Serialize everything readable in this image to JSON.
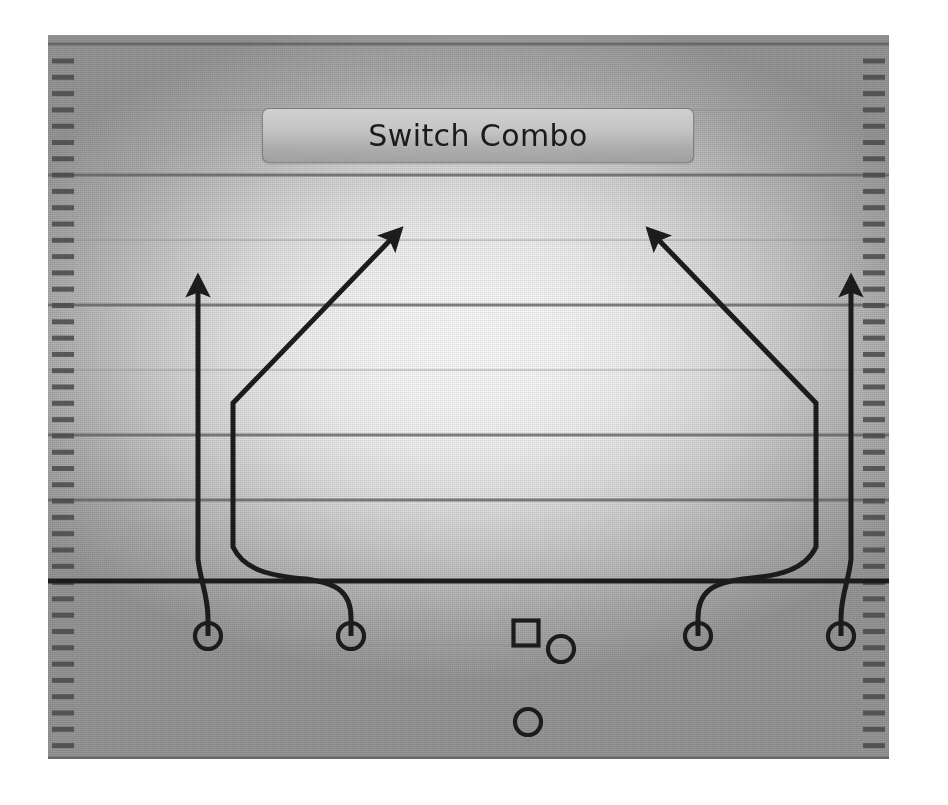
{
  "play": {
    "title": "Switch Combo",
    "banner": {
      "x": 262,
      "y": 108,
      "width": 432,
      "height": 55
    }
  },
  "field": {
    "x": 48,
    "y": 35,
    "width": 841,
    "height": 724,
    "background_center_color": "#fdfdfd",
    "background_edge_color": "#9a9a9a",
    "line_color": "#8d8d8d",
    "bold_line_color": "#5f5f5f",
    "ink_color": "#1c1c1c",
    "yard_lines": [
      9,
      75,
      140,
      205,
      270,
      335,
      400,
      465,
      610,
      675,
      723
    ],
    "bold_yard_lines": [
      9,
      140,
      270,
      400,
      465,
      723
    ],
    "hash_marks": {
      "count": 44,
      "spacing": 16.3,
      "start_y": 26,
      "length": 22,
      "thickness": 5,
      "left_x": 4,
      "right_x": 815
    },
    "line_of_scrimmage": {
      "y": 546,
      "thickness": 5,
      "color": "#1c1c1c"
    }
  },
  "players": [
    {
      "id": "wr-left-outside",
      "marker": "circle",
      "x": 160,
      "y": 601,
      "r": 13
    },
    {
      "id": "wr-left-inside",
      "marker": "circle",
      "x": 303,
      "y": 601,
      "r": 13
    },
    {
      "id": "center",
      "marker": "square",
      "x": 478,
      "y": 598,
      "size": 25
    },
    {
      "id": "quarterback",
      "marker": "circle",
      "x": 513,
      "y": 614,
      "r": 13
    },
    {
      "id": "running-back",
      "marker": "circle",
      "x": 480,
      "y": 687,
      "r": 13
    },
    {
      "id": "wr-right-inside",
      "marker": "circle",
      "x": 650,
      "y": 601,
      "r": 13
    },
    {
      "id": "wr-right-outside",
      "marker": "circle",
      "x": 793,
      "y": 601,
      "r": 13
    }
  ],
  "routes": [
    {
      "id": "route-left-vertical",
      "label": "Left outside receiver - release inside, vertical (go)",
      "type": "vertical",
      "arrow": true,
      "path": "M 160 601 L 160 583 C 160 560 152 545 150 524 L 150 244"
    },
    {
      "id": "route-left-diagonal",
      "label": "Left inside receiver - release outside, switch diagonal",
      "type": "diagonal",
      "arrow": true,
      "path": "M 303 601 L 303 583 C 303 558 290 548 258 544 C 222 541 196 535 185 512 L 185 368 L 351 196"
    },
    {
      "id": "route-right-vertical",
      "label": "Right outside receiver - release inside, vertical (go)",
      "type": "vertical",
      "arrow": true,
      "path": "M 793 601 L 793 583 C 793 560 801 545 803 524 L 803 244"
    },
    {
      "id": "route-right-diagonal",
      "label": "Right inside receiver - release outside, switch diagonal",
      "type": "diagonal",
      "arrow": true,
      "path": "M 650 601 L 650 583 C 650 558 663 548 695 544 C 731 541 757 535 768 512 L 768 368 L 602 196"
    }
  ]
}
